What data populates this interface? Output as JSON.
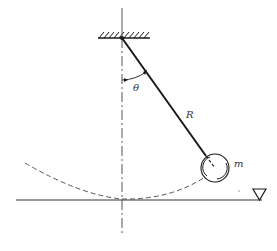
{
  "diagram": {
    "labels": {
      "angle": "θ",
      "length": "R",
      "mass": "m"
    },
    "colors": {
      "ink": "#1a1a1a",
      "light_ink": "#555555",
      "background": "#ffffff"
    },
    "geometry": {
      "pivot": [
        122,
        38
      ],
      "bob_center": [
        215,
        168
      ],
      "bob_radius": 14,
      "ground_y": 202
    }
  }
}
